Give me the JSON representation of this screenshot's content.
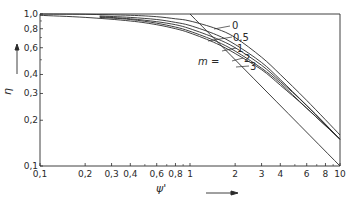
{
  "chart_data": {
    "type": "line",
    "title": "",
    "xlabel": "ψ'",
    "ylabel": "η",
    "xscale": "log",
    "yscale": "log",
    "xlim": [
      0.1,
      10
    ],
    "ylim": [
      0.1,
      1.0
    ],
    "grid": false,
    "x_ticks": [
      "0,1",
      "0,2",
      "0,3",
      "0,4",
      "0,6",
      "0,8",
      "1",
      "2",
      "3",
      "4",
      "6",
      "8",
      "10"
    ],
    "y_ticks": [
      "0,1",
      "0,2",
      "0,3",
      "0,4",
      "0,6",
      "0,8",
      "1,0"
    ],
    "legend_title": "m =",
    "series": [
      {
        "name": "asymptote",
        "label": "",
        "x": [
          1,
          10
        ],
        "y": [
          1.0,
          0.1
        ]
      },
      {
        "name": "m=0",
        "label": "0",
        "x": [
          0.1,
          0.2,
          0.4,
          0.6,
          0.8,
          1,
          1.5,
          2,
          3,
          4,
          6,
          10
        ],
        "y": [
          1.0,
          0.995,
          0.98,
          0.96,
          0.93,
          0.9,
          0.8,
          0.7,
          0.52,
          0.4,
          0.27,
          0.16
        ]
      },
      {
        "name": "m=0.5",
        "label": "0,5",
        "x": [
          0.25,
          0.4,
          0.6,
          0.8,
          1,
          1.5,
          2,
          3,
          4,
          6,
          10
        ],
        "y": [
          0.97,
          0.95,
          0.92,
          0.88,
          0.84,
          0.73,
          0.63,
          0.48,
          0.37,
          0.25,
          0.15
        ]
      },
      {
        "name": "m=1",
        "label": "1",
        "x": [
          0.25,
          0.4,
          0.6,
          0.8,
          1,
          1.5,
          2,
          3,
          4,
          6,
          10
        ],
        "y": [
          0.96,
          0.93,
          0.89,
          0.85,
          0.8,
          0.69,
          0.6,
          0.46,
          0.36,
          0.25,
          0.15
        ]
      },
      {
        "name": "m=2",
        "label": "2",
        "x": [
          0.25,
          0.4,
          0.6,
          0.8,
          1,
          1.5,
          2,
          3,
          4,
          6,
          10
        ],
        "y": [
          0.95,
          0.92,
          0.87,
          0.82,
          0.77,
          0.66,
          0.57,
          0.44,
          0.35,
          0.24,
          0.15
        ]
      },
      {
        "name": "m=3",
        "label": "3",
        "x": [
          0.1,
          0.2,
          0.4,
          0.6,
          0.8,
          1,
          1.5,
          2,
          3,
          4,
          6,
          10
        ],
        "y": [
          0.98,
          0.95,
          0.9,
          0.85,
          0.8,
          0.75,
          0.64,
          0.55,
          0.43,
          0.34,
          0.24,
          0.15
        ]
      }
    ],
    "annotations": [
      "0",
      "0,5",
      "1",
      "2",
      "3",
      "m ="
    ]
  }
}
